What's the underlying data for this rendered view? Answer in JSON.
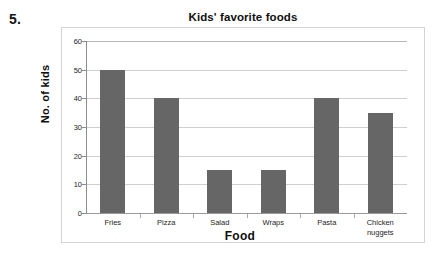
{
  "question": {
    "number": "5."
  },
  "chart_data": {
    "type": "bar",
    "title": "Kids' favorite foods",
    "xlabel": "Food",
    "ylabel": "No. of kids",
    "categories": [
      "Fries",
      "Pizza",
      "Salad",
      "Wraps",
      "Pasta",
      "Chicken nuggets"
    ],
    "category_lines": [
      [
        "Fries"
      ],
      [
        "Pizza"
      ],
      [
        "Salad"
      ],
      [
        "Wraps"
      ],
      [
        "Pasta"
      ],
      [
        "Chicken",
        "nuggets"
      ]
    ],
    "values": [
      50,
      40,
      15,
      15,
      40,
      35
    ],
    "ylim": [
      0,
      60
    ],
    "ytick_labels": [
      "60",
      "50",
      "40",
      "30",
      "20",
      "10",
      "0"
    ],
    "ytick_values": [
      60,
      50,
      40,
      30,
      20,
      10,
      0
    ],
    "ytick_step": 10,
    "grid": true,
    "legend": false,
    "bar_color": "#666666",
    "gridline_color": "#cfcfcf",
    "axis_color": "#8d8d8d",
    "frame_color": "#d3d3d3",
    "background": "#ffffff"
  }
}
